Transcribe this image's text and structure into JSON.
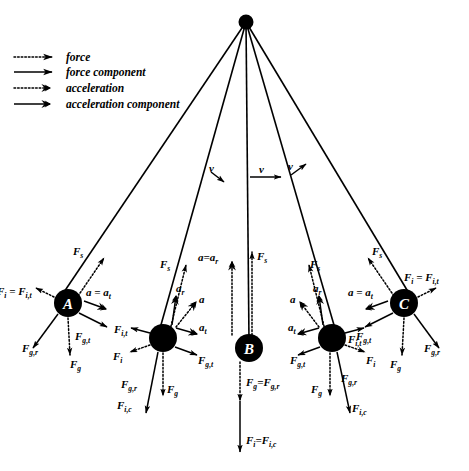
{
  "figure": {
    "background_color": "#ffffff",
    "ink_color": "#000000",
    "width": 469,
    "height": 471
  },
  "legend": {
    "items": [
      {
        "label": "force",
        "style": "dotted-thin-arrow",
        "name": "legend-force"
      },
      {
        "label": "force component",
        "style": "solid-thin-arrow",
        "name": "legend-force-component"
      },
      {
        "label": "acceleration",
        "style": "dotted-thick-arrow",
        "name": "legend-acceleration"
      },
      {
        "label": "acceleration component",
        "style": "solid-thick-arrow",
        "name": "legend-acceleration-component"
      }
    ]
  },
  "pivot": {
    "label": "",
    "x": 246,
    "y": 22,
    "radius": 7
  },
  "velocity_arrows": [
    {
      "label": "v",
      "x": 210,
      "y": 172,
      "direction": "down-right",
      "name": "velocity-left"
    },
    {
      "label": "v",
      "x": 246,
      "y": 176,
      "direction": "right",
      "name": "velocity-center"
    },
    {
      "label": "v",
      "x": 290,
      "y": 172,
      "direction": "up-right",
      "name": "velocity-right"
    }
  ],
  "bobs": [
    {
      "id": "A",
      "label": "A",
      "x": 68,
      "y": 303,
      "radius": 14,
      "position_note": "extreme left swing",
      "vectors": [
        {
          "label": "F_s",
          "text": "F",
          "sub": "s",
          "style": "dotted-thin",
          "dir": "up-right"
        },
        {
          "label": "F_i=F_i,t",
          "text": "F",
          "sub": "i",
          "style": "dotted-thin",
          "dir": "up-left"
        },
        {
          "label": "a=a_t",
          "text": "a",
          "sub": "t",
          "style": "solid-thick",
          "dir": "right-down"
        },
        {
          "label": "F_g,t",
          "text": "F",
          "sub": "g,t",
          "style": "solid-thin",
          "dir": "down-right"
        },
        {
          "label": "F_g,r",
          "text": "F",
          "sub": "g,r",
          "style": "solid-thin",
          "dir": "down-left"
        },
        {
          "label": "F_g",
          "text": "F",
          "sub": "g",
          "style": "dotted-thin",
          "dir": "down"
        }
      ]
    },
    {
      "id": "B2",
      "label": "",
      "x": 163,
      "y": 338,
      "radius": 14,
      "position_note": "intermediate left",
      "vectors": [
        {
          "label": "F_s",
          "text": "F",
          "sub": "s",
          "style": "dotted-thin",
          "dir": "up-right"
        },
        {
          "label": "a_r",
          "text": "a",
          "sub": "r",
          "style": "solid-thick",
          "dir": "up"
        },
        {
          "label": "a",
          "text": "a",
          "sub": "",
          "style": "dotted-thick",
          "dir": "up-right"
        },
        {
          "label": "a_t",
          "text": "a",
          "sub": "t",
          "style": "solid-thick",
          "dir": "right"
        },
        {
          "label": "F_i,t",
          "text": "F",
          "sub": "i,t",
          "style": "solid-thin",
          "dir": "left"
        },
        {
          "label": "F_i",
          "text": "F",
          "sub": "i",
          "style": "dotted-thin",
          "dir": "down-left"
        },
        {
          "label": "F_g,t",
          "text": "F",
          "sub": "g,t",
          "style": "solid-thin",
          "dir": "down-right"
        },
        {
          "label": "F_g",
          "text": "F",
          "sub": "g",
          "style": "dotted-thin",
          "dir": "down"
        },
        {
          "label": "F_g,r",
          "text": "F",
          "sub": "g,r",
          "style": "solid-thin",
          "dir": "down-left"
        },
        {
          "label": "F_i,c",
          "text": "F",
          "sub": "i,c",
          "style": "solid-thin",
          "dir": "down-left"
        }
      ]
    },
    {
      "id": "B",
      "label": "B",
      "x": 249,
      "y": 348,
      "radius": 14,
      "position_note": "lowest point of swing",
      "vectors": [
        {
          "label": "a=a_r",
          "text": "a",
          "sub": "r",
          "style": "dotted-thick",
          "dir": "up"
        },
        {
          "label": "F_s",
          "text": "F",
          "sub": "s",
          "style": "dotted-thin",
          "dir": "up"
        },
        {
          "label": "F_g=F_g,r",
          "text": "F",
          "sub": "g",
          "style": "dotted-thin",
          "dir": "down"
        },
        {
          "label": "F_i=F_i,c",
          "text": "F",
          "sub": "i",
          "style": "solid-thin",
          "dir": "down"
        }
      ]
    },
    {
      "id": "B4",
      "label": "",
      "x": 332,
      "y": 338,
      "radius": 14,
      "position_note": "intermediate right",
      "vectors": [
        {
          "label": "F_s",
          "text": "F",
          "sub": "s",
          "style": "dotted-thin",
          "dir": "up-left"
        },
        {
          "label": "a_r",
          "text": "a",
          "sub": "r",
          "style": "solid-thick",
          "dir": "up"
        },
        {
          "label": "a",
          "text": "a",
          "sub": "",
          "style": "dotted-thick",
          "dir": "up-left"
        },
        {
          "label": "a_t",
          "text": "a",
          "sub": "t",
          "style": "solid-thick",
          "dir": "left"
        },
        {
          "label": "F_i,t",
          "text": "F",
          "sub": "i,t",
          "style": "solid-thin",
          "dir": "right"
        },
        {
          "label": "F_i",
          "text": "F",
          "sub": "i",
          "style": "dotted-thin",
          "dir": "down-right"
        },
        {
          "label": "F_g,t",
          "text": "F",
          "sub": "g,t",
          "style": "solid-thin",
          "dir": "down-left"
        },
        {
          "label": "F_g",
          "text": "F",
          "sub": "g",
          "style": "dotted-thin",
          "dir": "down"
        },
        {
          "label": "F_g,r",
          "text": "F",
          "sub": "g,r",
          "style": "solid-thin",
          "dir": "down-right"
        },
        {
          "label": "F_i,c",
          "text": "F",
          "sub": "i,c",
          "style": "solid-thin",
          "dir": "down-right"
        }
      ]
    },
    {
      "id": "C",
      "label": "C",
      "x": 404,
      "y": 303,
      "radius": 14,
      "position_note": "extreme right swing",
      "vectors": [
        {
          "label": "F_s",
          "text": "F",
          "sub": "s",
          "style": "dotted-thin",
          "dir": "up-left"
        },
        {
          "label": "F_i=F_i,t",
          "text": "F",
          "sub": "i",
          "style": "dotted-thin",
          "dir": "up-right"
        },
        {
          "label": "a=a_t",
          "text": "a",
          "sub": "t",
          "style": "solid-thick",
          "dir": "left-down"
        },
        {
          "label": "F_g,t",
          "text": "F",
          "sub": "g,t",
          "style": "solid-thin",
          "dir": "down-left"
        },
        {
          "label": "F_g,r",
          "text": "F",
          "sub": "g,r",
          "style": "solid-thin",
          "dir": "down-right"
        },
        {
          "label": "F_g",
          "text": "F",
          "sub": "g",
          "style": "dotted-thin",
          "dir": "down"
        }
      ]
    }
  ],
  "symbols": {
    "F": "F",
    "a": "a",
    "v": "v",
    "eq": "=",
    "sub_s": "s",
    "sub_i": "i",
    "sub_g": "g",
    "sub_t": "t",
    "sub_r": "r",
    "sub_c": "c",
    "sub_it": "i,t",
    "sub_ic": "i,c",
    "sub_gt": "g,t",
    "sub_gr": "g,r"
  }
}
